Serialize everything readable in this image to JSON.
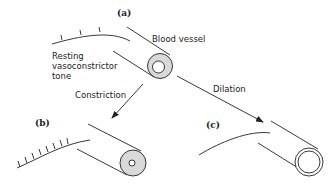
{
  "diagram": {
    "panels": [
      {
        "id": "a",
        "label": "(a)",
        "state": "resting"
      },
      {
        "id": "b",
        "label": "(b)",
        "state": "constricted"
      },
      {
        "id": "c",
        "label": "(c)",
        "state": "dilated"
      }
    ],
    "labels": {
      "blood_vessel": "Blood vessel",
      "resting_line1": "Resting",
      "resting_line2": "vasoconstrictor",
      "resting_line3": "tone",
      "constriction": "Constriction",
      "dilation": "Dilation"
    },
    "colors": {
      "ink": "#222222",
      "vessel_wall": "#d9d9d9",
      "lumen": "#ffffff",
      "background": "#ffffff"
    }
  }
}
